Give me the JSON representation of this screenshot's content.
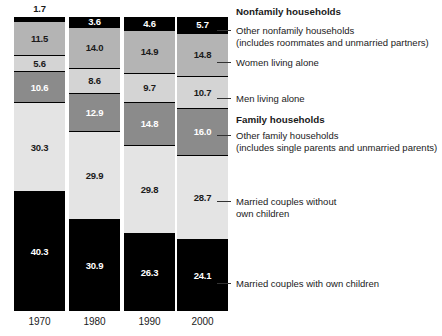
{
  "chart_data": {
    "type": "bar",
    "subtype": "stacked-bar-100-percent",
    "title": "",
    "subtitle": "",
    "xlabel": "",
    "ylabel": "",
    "ylim": [
      0,
      100
    ],
    "grid": false,
    "legend_position": "right",
    "categories": [
      "1970",
      "1980",
      "1990",
      "2000"
    ],
    "stack_order_top_to_bottom": [
      "Other nonfamily households",
      "Women living alone",
      "Men living alone",
      "Other family households",
      "Married couples without own children",
      "Married couples with own children"
    ],
    "series": [
      {
        "name": "Other nonfamily households",
        "group": "Nonfamily households",
        "color": "#000000",
        "label_color": "#ffffff",
        "values": [
          1.7,
          3.6,
          4.6,
          5.7
        ]
      },
      {
        "name": "Women living alone",
        "group": "Nonfamily households",
        "color": "#b4b4b4",
        "label_color": "#1a1a1a",
        "values": [
          11.5,
          14.0,
          14.9,
          14.8
        ]
      },
      {
        "name": "Men living alone",
        "group": "Nonfamily households",
        "color": "#d4d4d4",
        "label_color": "#1a1a1a",
        "values": [
          5.6,
          8.6,
          9.7,
          10.7
        ]
      },
      {
        "name": "Other family households",
        "group": "Family households",
        "color": "#8b8b8b",
        "label_color": "#ffffff",
        "values": [
          10.6,
          12.9,
          14.8,
          16.0
        ]
      },
      {
        "name": "Married couples without own children",
        "group": "Family households",
        "color": "#e4e4e4",
        "label_color": "#1a1a1a",
        "values": [
          30.3,
          29.9,
          29.8,
          28.7
        ]
      },
      {
        "name": "Married couples with own children",
        "group": "Family households",
        "color": "#000000",
        "label_color": "#ffffff",
        "values": [
          40.3,
          30.9,
          26.3,
          24.1
        ]
      }
    ]
  },
  "bars": [
    {
      "year": "1970",
      "above_label": "1.7",
      "segments": [
        {
          "value_label": "",
          "pct": 1.7,
          "fill": "f-black",
          "text": "t-light",
          "show_label": false
        },
        {
          "value_label": "11.5",
          "pct": 11.5,
          "fill": "f-mid",
          "text": "t-dark",
          "show_label": true
        },
        {
          "value_label": "5.6",
          "pct": 5.6,
          "fill": "f-light",
          "text": "t-dark",
          "show_label": true
        },
        {
          "value_label": "10.6",
          "pct": 10.6,
          "fill": "f-dark",
          "text": "t-light",
          "show_label": true
        },
        {
          "value_label": "30.3",
          "pct": 30.3,
          "fill": "f-pale",
          "text": "t-dark",
          "show_label": true
        },
        {
          "value_label": "40.3",
          "pct": 40.3,
          "fill": "f-black",
          "text": "t-light",
          "show_label": true
        }
      ]
    },
    {
      "year": "1980",
      "above_label": "",
      "segments": [
        {
          "value_label": "3.6",
          "pct": 3.6,
          "fill": "f-black",
          "text": "t-light",
          "show_label": true
        },
        {
          "value_label": "14.0",
          "pct": 14.0,
          "fill": "f-mid",
          "text": "t-dark",
          "show_label": true
        },
        {
          "value_label": "8.6",
          "pct": 8.6,
          "fill": "f-light",
          "text": "t-dark",
          "show_label": true
        },
        {
          "value_label": "12.9",
          "pct": 12.9,
          "fill": "f-dark",
          "text": "t-light",
          "show_label": true
        },
        {
          "value_label": "29.9",
          "pct": 29.9,
          "fill": "f-pale",
          "text": "t-dark",
          "show_label": true
        },
        {
          "value_label": "30.9",
          "pct": 30.9,
          "fill": "f-black",
          "text": "t-light",
          "show_label": true
        }
      ]
    },
    {
      "year": "1990",
      "above_label": "",
      "segments": [
        {
          "value_label": "4.6",
          "pct": 4.6,
          "fill": "f-black",
          "text": "t-light",
          "show_label": true
        },
        {
          "value_label": "14.9",
          "pct": 14.9,
          "fill": "f-mid",
          "text": "t-dark",
          "show_label": true
        },
        {
          "value_label": "9.7",
          "pct": 9.7,
          "fill": "f-light",
          "text": "t-dark",
          "show_label": true
        },
        {
          "value_label": "14.8",
          "pct": 14.8,
          "fill": "f-dark",
          "text": "t-light",
          "show_label": true
        },
        {
          "value_label": "29.8",
          "pct": 29.8,
          "fill": "f-pale",
          "text": "t-dark",
          "show_label": true
        },
        {
          "value_label": "26.3",
          "pct": 26.3,
          "fill": "f-black",
          "text": "t-light",
          "show_label": true
        }
      ]
    },
    {
      "year": "2000",
      "above_label": "",
      "segments": [
        {
          "value_label": "5.7",
          "pct": 5.7,
          "fill": "f-black",
          "text": "t-light",
          "show_label": true
        },
        {
          "value_label": "14.8",
          "pct": 14.8,
          "fill": "f-mid",
          "text": "t-dark",
          "show_label": true
        },
        {
          "value_label": "10.7",
          "pct": 10.7,
          "fill": "f-light",
          "text": "t-dark",
          "show_label": true
        },
        {
          "value_label": "16.0",
          "pct": 16.0,
          "fill": "f-dark",
          "text": "t-light",
          "show_label": true
        },
        {
          "value_label": "28.7",
          "pct": 28.7,
          "fill": "f-pale",
          "text": "t-dark",
          "show_label": true
        },
        {
          "value_label": "24.1",
          "pct": 24.1,
          "fill": "f-black",
          "text": "t-light",
          "show_label": true
        }
      ]
    }
  ],
  "legend": {
    "entries": [
      {
        "kind": "heading",
        "label": "Nonfamily households",
        "sub": "",
        "top": 6,
        "leader": null
      },
      {
        "kind": "item",
        "label": "Other nonfamily households",
        "sub": "(includes roommates and unmarried partners)",
        "top": 25,
        "leader": 30
      },
      {
        "kind": "item",
        "label": "Women living alone",
        "sub": "",
        "top": 57,
        "leader": 62
      },
      {
        "kind": "item",
        "label": "Men living alone",
        "sub": "",
        "top": 93,
        "leader": 98
      },
      {
        "kind": "heading",
        "label": "Family households",
        "sub": "",
        "top": 114,
        "leader": null
      },
      {
        "kind": "item",
        "label": "Other family households",
        "sub": "(includes single parents and unmarried parents)",
        "top": 130,
        "leader": 135
      },
      {
        "kind": "item",
        "label": "Married couples without",
        "sub": "own children",
        "top": 196,
        "leader": 201
      },
      {
        "kind": "item",
        "label": "Married couples with own children",
        "sub": "",
        "top": 278,
        "leader": 283
      }
    ]
  },
  "layout": {
    "bar_lefts": [
      14,
      69,
      124,
      177
    ],
    "bar_widths": [
      51,
      51,
      51,
      51
    ],
    "bar_top": 17,
    "bar_height": 294
  }
}
